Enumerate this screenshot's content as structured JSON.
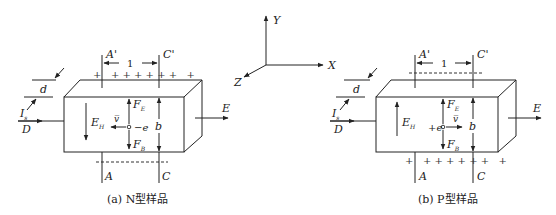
{
  "axes": {
    "x": "X",
    "y": "Y",
    "z": "Z"
  },
  "figures": [
    {
      "caption": "(a) N型样品",
      "top_label_left": "A'",
      "top_label_right": "C'",
      "bottom_label_left": "A",
      "bottom_label_right": "C",
      "length_label": "1",
      "thickness_label": "d",
      "height_label": "b",
      "current_label": "I",
      "current_sub": "s",
      "electrode_label": "D",
      "field_label": "E",
      "hall_field_label": "E",
      "hall_field_sub": "H",
      "force_e_label": "F",
      "force_e_sub": "E",
      "force_b_label": "F",
      "force_b_sub": "B",
      "velocity_label": "v̅",
      "charge_label": "−e",
      "top_charges": "+   + + + + + +   +",
      "bottom_charges": ""
    },
    {
      "caption": "(b) P型样品",
      "top_label_left": "A'",
      "top_label_right": "C'",
      "bottom_label_left": "A",
      "bottom_label_right": "C",
      "length_label": "1",
      "thickness_label": "d",
      "height_label": "b",
      "current_label": "I",
      "current_sub": "s",
      "electrode_label": "D",
      "field_label": "E",
      "hall_field_label": "E",
      "hall_field_sub": "H",
      "force_e_label": "F",
      "force_e_sub": "E",
      "force_b_label": "F",
      "force_b_sub": "B",
      "velocity_label": "v̅",
      "charge_label": "+e",
      "top_charges": "",
      "bottom_charges": "+   + + + + + +   +"
    }
  ]
}
